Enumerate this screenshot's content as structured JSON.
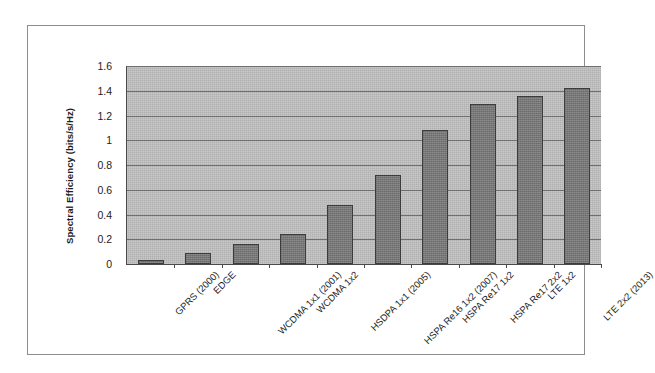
{
  "chart_data": {
    "type": "bar",
    "title": "",
    "xlabel": "",
    "ylabel": "Spectral Efficiency (bits/s/Hz)",
    "ylim": [
      0,
      1.6
    ],
    "ytick_labels": [
      "1.6",
      "1.4",
      "1.2",
      "1",
      "0.8",
      "0.6",
      "0.4",
      "0.2",
      "0"
    ],
    "ytick_values": [
      1.6,
      1.4,
      1.2,
      1.0,
      0.8,
      0.6,
      0.4,
      0.2,
      0
    ],
    "grid": true,
    "legend": "none",
    "categories": [
      "GPRS (2000)",
      "EDGE",
      "WCDMA 1x1 (2001)",
      "WCDMA 1x2",
      "HSDPA 1x1 (2005)",
      "HSPA Re16 1x2 (2007)",
      "HSPA Re17 1x2",
      "HSPA Re17 2x2",
      "LTE 1x2",
      "LTE 2x2 (2013)"
    ],
    "values": [
      0.03,
      0.09,
      0.16,
      0.24,
      0.48,
      0.72,
      1.08,
      1.29,
      1.36,
      1.42
    ],
    "bar_color": "#777777",
    "plot_background": "#b0b0b0",
    "gridline_color": "#6f6f6f",
    "axis_color": "#4a4a4a",
    "frame_color": "#8d8d8d"
  }
}
